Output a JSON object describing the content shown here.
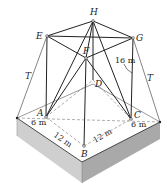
{
  "figure": {
    "type": "3D truss tower / support structure on a block base",
    "points": {
      "H": {
        "label": "H",
        "x": 93,
        "y": 21
      },
      "E": {
        "label": "E",
        "x": 47,
        "y": 36
      },
      "G": {
        "label": "G",
        "x": 133,
        "y": 38
      },
      "F": {
        "label": "F",
        "x": 86,
        "y": 58
      },
      "D": {
        "label": "D",
        "x": 93,
        "y": 80
      },
      "A": {
        "label": "A",
        "x": 46,
        "y": 117
      },
      "C": {
        "label": "C",
        "x": 131,
        "y": 119
      },
      "B": {
        "label": "B",
        "x": 84,
        "y": 146
      }
    },
    "labels": {
      "H": "H",
      "E": "E",
      "G": "G",
      "F": "F",
      "D": "D",
      "A": "A",
      "B": "B",
      "C": "C",
      "T_left": "T",
      "T_right": "T"
    },
    "dimensions": {
      "height": "16 m",
      "left_offset": "6 m",
      "right_offset": "6 m",
      "AB": "12 m",
      "BC": "12 m"
    },
    "colors": {
      "line": "#222222",
      "dashed": "#777777",
      "block_left": "#c8c8c8",
      "block_right": "#a8a8a8",
      "block_top": "#ffffff"
    }
  }
}
